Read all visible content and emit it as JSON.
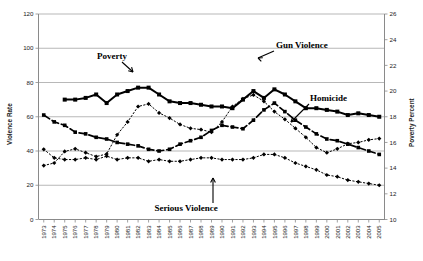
{
  "chart_data": {
    "type": "line",
    "title": "",
    "xlabel": "",
    "ylabel": "Violence Rate",
    "y2label": "Poverty Percent",
    "ylim": [
      0,
      120
    ],
    "y2lim": [
      10,
      26
    ],
    "yticks": [
      0,
      20,
      40,
      60,
      80,
      100,
      120
    ],
    "y2ticks": [
      10,
      12,
      14,
      16,
      18,
      20,
      22,
      24,
      26
    ],
    "grid": true,
    "legend_position": "inline-annotations",
    "categories": [
      "1973",
      "1974",
      "1975",
      "1976",
      "1977",
      "1978",
      "1979",
      "1980",
      "1981",
      "1982",
      "1983",
      "1984",
      "1985",
      "1986",
      "1987",
      "1988",
      "1989",
      "1990",
      "1991",
      "1992",
      "1993",
      "1994",
      "1995",
      "1996",
      "1997",
      "1998",
      "1999",
      "2000",
      "2001",
      "2002",
      "2003",
      "2004",
      "2005"
    ],
    "series": [
      {
        "name": "Serious Violence",
        "axis": "left",
        "style": "dotted",
        "marker": "diamond",
        "values": [
          41,
          36,
          35,
          35,
          36,
          35,
          37,
          35,
          36,
          36,
          34,
          35,
          34,
          34,
          35,
          36,
          36,
          35,
          35,
          35,
          36,
          38,
          38,
          36,
          33,
          31,
          29,
          26,
          25,
          23,
          22,
          21,
          20
        ]
      },
      {
        "name": "Homicide",
        "axis": "left",
        "style": "dashed",
        "marker": "square",
        "values": [
          61,
          57,
          55,
          51,
          50,
          48,
          47,
          45,
          44,
          43,
          41,
          40,
          41,
          44,
          46,
          48,
          52,
          55,
          54,
          53,
          58,
          64,
          68,
          63,
          58,
          54,
          50,
          47,
          46,
          44,
          42,
          40,
          38
        ]
      },
      {
        "name": "Gun Violence",
        "axis": "left",
        "style": "solid",
        "marker": "square",
        "values": [
          null,
          null,
          70,
          70,
          71,
          73,
          68,
          73,
          75,
          77,
          77,
          73,
          69,
          68,
          68,
          67,
          66,
          66,
          65,
          70,
          75,
          71,
          76,
          73,
          69,
          65,
          65,
          64,
          63,
          61,
          62,
          61,
          60
        ]
      },
      {
        "name": "Poverty",
        "axis": "right",
        "style": "dotted",
        "marker": "diamond",
        "values": [
          14.2,
          14.4,
          15.3,
          15.5,
          15.2,
          14.9,
          15.1,
          16.6,
          17.6,
          18.8,
          19.0,
          18.3,
          17.9,
          17.4,
          17.1,
          17.0,
          16.8,
          17.6,
          18.8,
          19.4,
          19.7,
          19.2,
          18.4,
          17.8,
          17.1,
          16.4,
          15.6,
          15.2,
          15.5,
          15.9,
          16.0,
          16.2,
          16.3
        ]
      }
    ],
    "annotations": [
      {
        "id": "poverty-label",
        "text": "Poverty"
      },
      {
        "id": "gun-violence-label",
        "text": "Gun Violence"
      },
      {
        "id": "homicide-label",
        "text": "Homicide"
      },
      {
        "id": "serious-violence-label",
        "text": "Serious Violence"
      }
    ]
  },
  "colors": {
    "line": "#000000",
    "grid": "#9a9a9a",
    "axis": "#8a8a8a",
    "background": "#ffffff"
  }
}
